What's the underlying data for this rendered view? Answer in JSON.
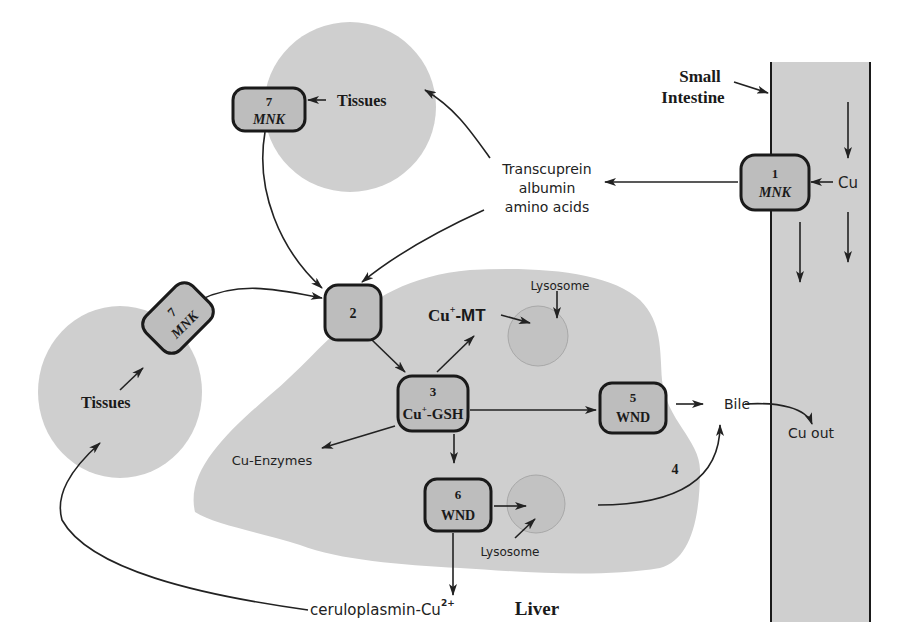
{
  "diagram": {
    "type": "copper-metabolism-pathway",
    "colors": {
      "region_fill": "#cfcfcf",
      "box_fill": "#bdbdbd",
      "box_stroke": "#1a1a1a",
      "lysosome_fill": "#c2c2c2",
      "arrow": "#222222"
    },
    "regions": {
      "small_intestine": {
        "label_line1": "Small",
        "label_line2": "Intestine"
      },
      "liver": {
        "label": "Liver"
      },
      "tissues_top": {
        "label": "Tissues"
      },
      "tissues_left": {
        "label": "Tissues"
      },
      "lysosome_top": {
        "label": "Lysosome"
      },
      "lysosome_bottom": {
        "label": "Lysosome"
      }
    },
    "boxes": {
      "box1": {
        "number": "1",
        "name": "MNK"
      },
      "box2": {
        "number": "2"
      },
      "box3": {
        "number": "3",
        "name": "Cu",
        "sup": "+",
        "suffix": "-GSH"
      },
      "box5": {
        "number": "5",
        "name": "WND"
      },
      "box6": {
        "number": "6",
        "name": "WND"
      },
      "box7_top": {
        "number": "7",
        "name": "MNK"
      },
      "box7_left": {
        "number": "7",
        "name": "MNK"
      }
    },
    "labels": {
      "cu_input": "Cu",
      "transport_line1": "Transcuprein",
      "transport_line2": "albumin",
      "transport_line3": "amino acids",
      "cu_mt_base": "Cu",
      "cu_mt_sup": "+",
      "cu_mt_suffix": "-MT",
      "cu_enzymes": "Cu-Enzymes",
      "bile": "Bile",
      "cu_out": "Cu out",
      "pathway4": "4",
      "ceruloplasmin_base": "ceruloplasmin-Cu",
      "ceruloplasmin_sup": "2+"
    }
  }
}
